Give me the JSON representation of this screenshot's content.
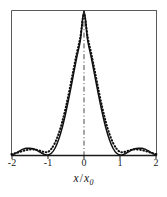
{
  "figure": {
    "axis_label_x_var": "x",
    "axis_label_x_sep": "/",
    "axis_label_x_denom": "x",
    "axis_label_x_denom_sub": "0",
    "frame_color": "#555555",
    "curve_color": "#111111",
    "center_line_color": "#444444"
  },
  "ticks": {
    "labels": [
      "-2",
      "-1",
      "0",
      "1",
      "2"
    ],
    "values": [
      -2,
      -1,
      0,
      1,
      2
    ]
  },
  "chart_data": {
    "type": "line",
    "title": "",
    "xlabel": "x / x0",
    "ylabel": "",
    "xlim": [
      -2,
      2
    ],
    "ylim": [
      0,
      1
    ],
    "grid": false,
    "legend": "none",
    "xticks": [
      -2,
      -1,
      0,
      1,
      2
    ],
    "xticklabels": [
      "-2",
      "-1",
      "0",
      "1",
      "2"
    ],
    "annotations": [
      {
        "type": "vertical-line",
        "x": 0,
        "style": "dash-dot",
        "label": ""
      }
    ],
    "series": [
      {
        "name": "solid-curve",
        "style": "solid",
        "x": [
          -2.0,
          -1.9,
          -1.8,
          -1.7,
          -1.6,
          -1.5,
          -1.4,
          -1.3,
          -1.2,
          -1.1,
          -1.0,
          -0.9,
          -0.8,
          -0.7,
          -0.6,
          -0.5,
          -0.4,
          -0.3,
          -0.2,
          -0.1,
          0.0,
          0.1,
          0.2,
          0.3,
          0.4,
          0.5,
          0.6,
          0.7,
          0.8,
          0.9,
          1.0,
          1.1,
          1.2,
          1.3,
          1.4,
          1.5,
          1.6,
          1.7,
          1.8,
          1.9,
          2.0
        ],
        "y": [
          0.0,
          0.009,
          0.025,
          0.039,
          0.047,
          0.047,
          0.043,
          0.032,
          0.018,
          0.005,
          0.0,
          0.012,
          0.047,
          0.107,
          0.191,
          0.297,
          0.418,
          0.547,
          0.678,
          0.797,
          1.0,
          0.797,
          0.678,
          0.547,
          0.418,
          0.297,
          0.191,
          0.107,
          0.047,
          0.012,
          0.0,
          0.005,
          0.018,
          0.032,
          0.043,
          0.047,
          0.047,
          0.039,
          0.025,
          0.009,
          0.0
        ]
      },
      {
        "name": "dotted-curve",
        "style": "dotted",
        "x": [
          -2.0,
          -1.9,
          -1.8,
          -1.7,
          -1.6,
          -1.5,
          -1.4,
          -1.3,
          -1.2,
          -1.1,
          -1.0,
          -0.9,
          -0.8,
          -0.7,
          -0.6,
          -0.5,
          -0.4,
          -0.3,
          -0.2,
          -0.1,
          0.0,
          0.1,
          0.2,
          0.3,
          0.4,
          0.5,
          0.6,
          0.7,
          0.8,
          0.9,
          1.0,
          1.1,
          1.2,
          1.3,
          1.4,
          1.5,
          1.6,
          1.7,
          1.8,
          1.9,
          2.0
        ],
        "y": [
          0.006,
          0.012,
          0.019,
          0.027,
          0.034,
          0.038,
          0.039,
          0.035,
          0.028,
          0.021,
          0.021,
          0.043,
          0.085,
          0.147,
          0.231,
          0.333,
          0.452,
          0.58,
          0.705,
          0.82,
          0.978,
          0.82,
          0.705,
          0.58,
          0.452,
          0.333,
          0.231,
          0.147,
          0.085,
          0.043,
          0.021,
          0.021,
          0.028,
          0.035,
          0.039,
          0.038,
          0.034,
          0.027,
          0.019,
          0.012,
          0.006
        ]
      }
    ]
  }
}
